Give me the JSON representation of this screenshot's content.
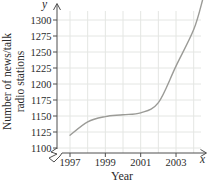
{
  "chart_data": {
    "type": "line",
    "title": "",
    "xlabel": "Year",
    "ylabel_lines": [
      "Number of news/talk",
      "radio stations"
    ],
    "x_axis_symbol": "x",
    "y_axis_symbol": "y",
    "x_ticks": [
      1997,
      1999,
      2001,
      2003
    ],
    "x_gridline_years": [
      1997,
      1998,
      1999,
      2000,
      2001,
      2002,
      2003,
      2004
    ],
    "y_ticks": [
      1100,
      1125,
      1150,
      1175,
      1200,
      1225,
      1250,
      1275,
      1300
    ],
    "xlim": [
      1997,
      2004.5
    ],
    "ylim": [
      1100,
      1300
    ],
    "grid": true,
    "legend": "none",
    "axis_break_at_origin": true,
    "series": [
      {
        "name": "news-talk-radio-stations",
        "x": [
          1997,
          1998,
          1999,
          2000,
          2001,
          2002,
          2003,
          2004,
          2004.5
        ],
        "y": [
          1120,
          1141,
          1149,
          1152,
          1155,
          1171,
          1228,
          1285,
          1331
        ]
      }
    ],
    "colors": {
      "curve": "#9b9b97",
      "grid": "#e4e6e3",
      "axis": "#4f4f4f",
      "text": "#2b2b2b"
    }
  }
}
